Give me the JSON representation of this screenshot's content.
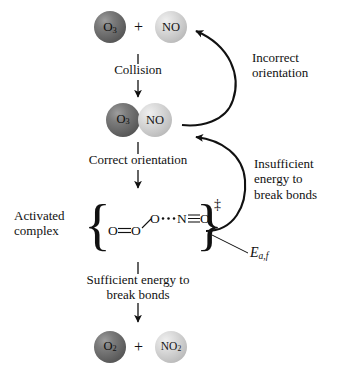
{
  "figure": {
    "type": "reaction-mechanism-diagram",
    "background_color": "#ffffff",
    "ink_color": "#111111"
  },
  "palette": {
    "dark_sphere": "#636363",
    "light_sphere": "#c6c6c6",
    "text": "#111111"
  },
  "reactants": {
    "left": {
      "formula": "O",
      "subscript": "3",
      "shade": "dark"
    },
    "operator": "+",
    "right": {
      "formula": "NO",
      "subscript": "",
      "shade": "light"
    }
  },
  "collision_complex": {
    "left": {
      "formula": "O",
      "subscript": "3",
      "shade": "dark"
    },
    "right": {
      "formula": "NO",
      "subscript": "",
      "shade": "light"
    }
  },
  "products": {
    "left": {
      "formula": "O",
      "subscript": "2",
      "shade": "dark"
    },
    "operator": "+",
    "right": {
      "formula": "NO",
      "subscript": "2",
      "shade": "light"
    }
  },
  "steps": {
    "collision": "Collision",
    "correct_orientation": "Correct orientation",
    "sufficient_energy": "Sufficient energy to\nbreak bonds"
  },
  "feedback_labels": {
    "incorrect_orientation": "Incorrect\norientation",
    "insufficient_energy": "Insufficient\nenergy to\nbreak bonds"
  },
  "activated_complex": {
    "label": "Activated\ncomplex",
    "formula": "O=O—O···N≡O",
    "formula_parts": {
      "a1": "O",
      "bond1": "double-bond",
      "a2": "O",
      "bond2": "single-bond-diagonal",
      "a3": "O",
      "bond3": "dotted-bond",
      "a4": "N",
      "bond4": "triple-bond",
      "a5": "O"
    },
    "superscript": "‡",
    "open_brace": "{",
    "close_brace": "}"
  },
  "energy_label": {
    "symbol": "E",
    "subscript": "a,f"
  }
}
